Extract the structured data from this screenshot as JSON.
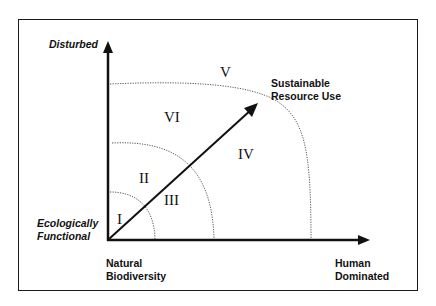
{
  "axes": {
    "y_label_top": "Disturbed",
    "origin_label_line1": "Ecologically",
    "origin_label_line2": "Functional",
    "x_label_origin_line1": "Natural",
    "x_label_origin_line2": "Biodiversity",
    "x_label_end_line1": "Human",
    "x_label_end_line2": "Dominated"
  },
  "arrow": {
    "label_line1": "Sustainable",
    "label_line2": "Resource Use"
  },
  "regions": {
    "r1": "I",
    "r2": "II",
    "r3": "III",
    "r4": "IV",
    "r5": "V",
    "r6": "VI"
  },
  "colors": {
    "line": "#111111",
    "dotted": "#555555",
    "background": "#ffffff"
  }
}
